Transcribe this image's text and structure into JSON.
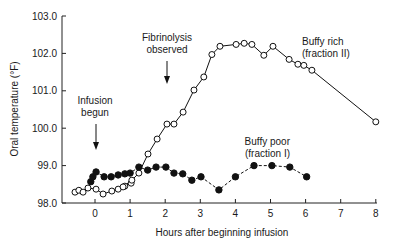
{
  "chart_data": {
    "type": "line",
    "title": "",
    "xlabel": "Hours after beginning infusion",
    "ylabel": "Oral temperature (°F)",
    "xlim": [
      -0.9,
      8.1
    ],
    "ylim": [
      98.0,
      103.0
    ],
    "x_ticks": [
      "0",
      "1",
      "2",
      "3",
      "4",
      "5",
      "6",
      "7",
      "8"
    ],
    "x_tick_values": [
      0,
      1,
      2,
      3,
      4,
      5,
      6,
      7,
      8
    ],
    "y_ticks": [
      "98.0",
      "99.0",
      "100.0",
      "101.0",
      "102.0",
      "103.0"
    ],
    "y_tick_values": [
      98,
      99,
      100,
      101,
      102,
      103
    ],
    "grid": false,
    "series": [
      {
        "name": "Buffy rich (fraction II)",
        "marker": "open-circle",
        "line": "solid",
        "x": [
          -0.57,
          -0.46,
          -0.34,
          -0.2,
          0.03,
          0.23,
          0.48,
          0.66,
          0.85,
          1.03,
          0.8,
          1.05,
          1.25,
          1.51,
          1.77,
          2.05,
          2.25,
          2.51,
          2.82,
          3.1,
          3.33,
          3.56,
          4.02,
          4.25,
          4.47,
          4.81,
          5.07,
          5.53,
          5.78,
          5.95,
          6.18,
          8.0
        ],
        "y": [
          98.29,
          98.34,
          98.29,
          98.4,
          98.37,
          98.24,
          98.32,
          98.37,
          98.45,
          98.53,
          98.43,
          98.61,
          98.8,
          99.31,
          99.71,
          100.11,
          100.11,
          100.43,
          101.02,
          101.37,
          101.97,
          102.19,
          102.24,
          102.27,
          102.24,
          101.95,
          102.19,
          101.84,
          101.71,
          101.68,
          101.55,
          100.17
        ]
      },
      {
        "name": "Buffy poor (fraction I)",
        "marker": "filled-circle",
        "line": "dashed",
        "x": [
          -0.12,
          -0.06,
          0.03,
          0.26,
          0.46,
          0.66,
          0.85,
          1.0,
          1.25,
          1.5,
          1.74,
          2.02,
          2.25,
          2.5,
          2.76,
          3.02,
          3.53,
          4.0,
          4.53,
          5.04,
          5.55,
          6.03
        ],
        "y": [
          98.57,
          98.7,
          98.83,
          98.7,
          98.7,
          98.75,
          98.78,
          98.8,
          98.96,
          98.88,
          98.96,
          98.96,
          98.8,
          98.78,
          98.61,
          98.7,
          98.35,
          98.7,
          99.0,
          99.0,
          98.96,
          98.7
        ]
      }
    ],
    "annotations": [
      {
        "lines": [
          "Infusion",
          "begun"
        ],
        "arrow_x": 0,
        "label_anchor_hour": 0
      },
      {
        "lines": [
          "Fibrinolysis",
          "observed"
        ],
        "arrow_x": 2
      },
      {
        "lines": [
          "Buffy rich",
          "(fraction II)"
        ]
      },
      {
        "lines": [
          "Buffy poor",
          "(fraction I)"
        ]
      }
    ]
  }
}
